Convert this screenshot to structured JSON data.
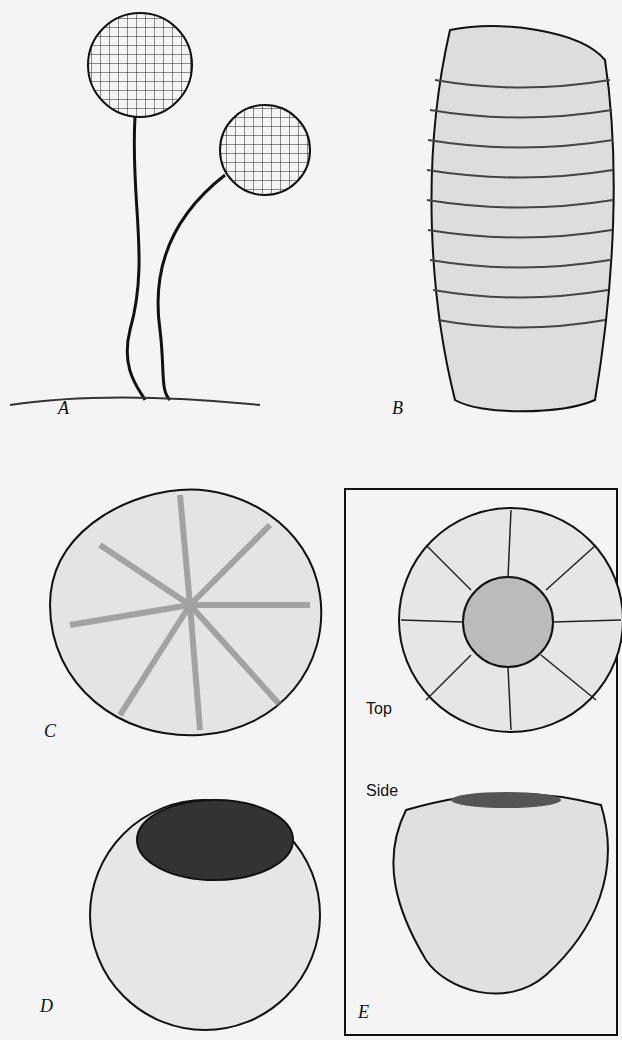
{
  "figure": {
    "panels": [
      {
        "id": "A",
        "label": "A",
        "description": "Two stalked spherical sporangia with netted surface and bristles"
      },
      {
        "id": "B",
        "label": "B",
        "description": "Elongated barrel-shaped ribbed body"
      },
      {
        "id": "C",
        "label": "C",
        "description": "Lobed rounded body with radiating ribs and spots"
      },
      {
        "id": "D",
        "label": "D",
        "description": "Rounded cup with pitted open top"
      },
      {
        "id": "E",
        "label": "E",
        "description": "Boxed panel showing top and side views",
        "views": [
          "Top",
          "Side"
        ]
      }
    ]
  }
}
